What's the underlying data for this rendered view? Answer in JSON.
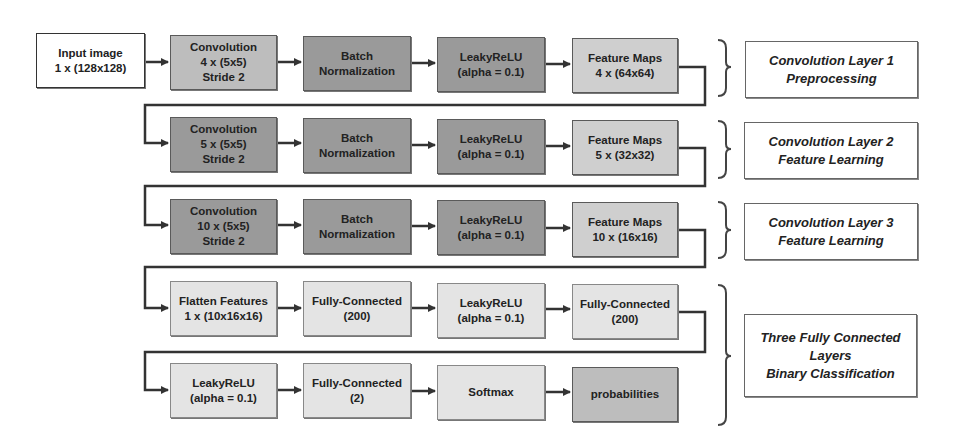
{
  "diagram": {
    "input": {
      "label": "Input image\n1 x (128x128)"
    },
    "rows": [
      {
        "blocks": [
          {
            "label": "Convolution\n4 x (5x5)\nStride 2",
            "shade": "mid"
          },
          {
            "label": "Batch\nNormalization",
            "shade": "dark"
          },
          {
            "label": "LeakyReLU\n(alpha = 0.1)",
            "shade": "dark"
          },
          {
            "label": "Feature Maps\n4 x (64x64)",
            "shade": "fm"
          }
        ],
        "group_label": "Convolution Layer 1\nPreprocessing"
      },
      {
        "blocks": [
          {
            "label": "Convolution\n5 x (5x5)\nStride 2",
            "shade": "dark"
          },
          {
            "label": "Batch\nNormalization",
            "shade": "dark"
          },
          {
            "label": "LeakyReLU\n(alpha = 0.1)",
            "shade": "dark"
          },
          {
            "label": "Feature Maps\n5 x (32x32)",
            "shade": "fm"
          }
        ],
        "group_label": "Convolution Layer 2\nFeature Learning"
      },
      {
        "blocks": [
          {
            "label": "Convolution\n10 x (5x5)\nStride 2",
            "shade": "dark"
          },
          {
            "label": "Batch\nNormalization",
            "shade": "dark"
          },
          {
            "label": "LeakyReLU\n(alpha = 0.1)",
            "shade": "dark"
          },
          {
            "label": "Feature Maps\n10 x (16x16)",
            "shade": "fm"
          }
        ],
        "group_label": "Convolution Layer 3\nFeature Learning"
      },
      {
        "blocks": [
          {
            "label": "Flatten Features\n1 x (10x16x16)",
            "shade": "light"
          },
          {
            "label": "Fully-Connected\n(200)",
            "shade": "light"
          },
          {
            "label": "LeakyReLU\n(alpha = 0.1)",
            "shade": "light"
          },
          {
            "label": "Fully-Connected\n(200)",
            "shade": "light"
          }
        ]
      },
      {
        "blocks": [
          {
            "label": "LeakyReLU\n(alpha = 0.1)",
            "shade": "light"
          },
          {
            "label": "Fully-Connected\n(2)",
            "shade": "light"
          },
          {
            "label": "Softmax",
            "shade": "light"
          },
          {
            "label": "probabilities",
            "shade": "mid"
          }
        ],
        "group_label": "Three Fully Connected\nLayers\nBinary Classification"
      }
    ],
    "colors": {
      "dark": "#9a9a9a",
      "mid": "#bdbdbd",
      "light": "#e4e4e4",
      "line": "#333333"
    }
  }
}
